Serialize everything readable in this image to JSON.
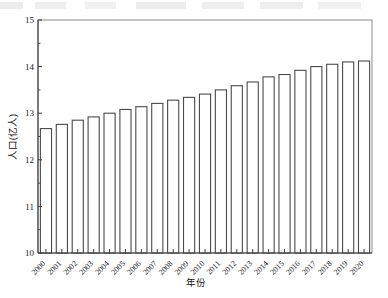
{
  "chart_data": {
    "type": "bar",
    "title": "",
    "subtitle": "",
    "xlabel": "年份",
    "ylabel": "人口(亿人)",
    "ylim": [
      10,
      15
    ],
    "ytick_labels": [
      "10",
      "11",
      "12",
      "13",
      "14",
      "15"
    ],
    "yticks": [
      10,
      11,
      12,
      13,
      14,
      15
    ],
    "y_minor_ticks": [
      10.5,
      11.5,
      12.5,
      13.5,
      14.5
    ],
    "grid": false,
    "legend": null,
    "legend_position": "none",
    "bar_face_color": "#ffffff",
    "bar_edge_color": "#4a4a4a",
    "axis_color": "#3d3d3d",
    "frame_color": "#8a8a8a",
    "categories": [
      "2000",
      "2001",
      "2002",
      "2003",
      "2004",
      "2005",
      "2006",
      "2007",
      "2008",
      "2009",
      "2010",
      "2011",
      "2012",
      "2013",
      "2014",
      "2015",
      "2016",
      "2017",
      "2018",
      "2019",
      "2020"
    ],
    "values": [
      12.67,
      12.76,
      12.85,
      12.92,
      13.0,
      13.08,
      13.14,
      13.21,
      13.28,
      13.34,
      13.41,
      13.5,
      13.59,
      13.67,
      13.78,
      13.83,
      13.92,
      14.0,
      14.05,
      14.1,
      14.12
    ],
    "units": "亿人",
    "xtick_label_rotation": 45
  }
}
